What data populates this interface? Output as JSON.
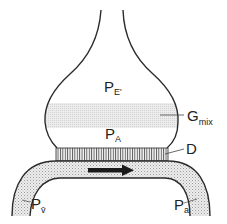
{
  "diagram": {
    "type": "alveolus-capillary gas exchange schematic",
    "labels": {
      "p_e_prime": {
        "main": "P",
        "sub": "E'"
      },
      "g_mix": {
        "main": "G",
        "sub": "mix"
      },
      "p_a_alveolar": {
        "main": "P",
        "sub": "A"
      },
      "d": {
        "main": "D"
      },
      "p_v_bar": {
        "main": "P",
        "sub": "v̄"
      },
      "p_a_arterial": {
        "main": "P",
        "sub": "a"
      }
    },
    "regions": {
      "mixing_zone": "G_mix shaded band",
      "diffusion_membrane": "D hatched membrane",
      "capillary": "stippled blood vessel"
    },
    "flow_direction": "left-to-right",
    "colors": {
      "stroke": "#2b2b2b",
      "stipple": "#d9d9d9",
      "gmix_band": "#e6e6e6",
      "arrow": "#1a1a1a"
    }
  }
}
